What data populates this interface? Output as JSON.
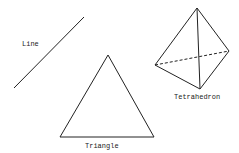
{
  "shapes": {
    "line": {
      "label": "Line",
      "points": [
        [
          14,
          88
        ],
        [
          84,
          17
        ]
      ],
      "label_pos": [
        22,
        46
      ]
    },
    "triangle": {
      "label": "Triangle",
      "points": [
        [
          108,
          55
        ],
        [
          60,
          137
        ],
        [
          154,
          137
        ]
      ],
      "label_pos": [
        85,
        148
      ]
    },
    "tetrahedron": {
      "label": "Tetrahedron",
      "apex": [
        197,
        8
      ],
      "left": [
        155,
        65
      ],
      "right": [
        229,
        51
      ],
      "bottom": [
        200,
        89
      ],
      "hidden_edge": "left-right (dashed)",
      "label_pos": [
        174,
        99
      ]
    }
  },
  "colors": {
    "stroke": "#222222",
    "background": "#ffffff"
  }
}
